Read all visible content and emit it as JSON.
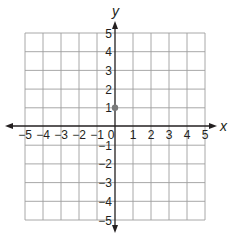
{
  "chart_data": {
    "type": "scatter",
    "title": "",
    "xlabel": "x",
    "ylabel": "y",
    "xlim": [
      -5,
      5
    ],
    "ylim": [
      -5,
      5
    ],
    "grid": true,
    "x_ticks": [
      "−5",
      "−4",
      "−3",
      "−2",
      "−1",
      "0",
      "1",
      "2",
      "3",
      "4",
      "5"
    ],
    "y_ticks": [
      "5",
      "4",
      "3",
      "2",
      "1",
      "−1",
      "−2",
      "−3",
      "−4",
      "−5"
    ],
    "points": [
      {
        "x": 0,
        "y": 1
      }
    ],
    "colors": {
      "grid": "#9e9e9e",
      "axis": "#231f20",
      "point": "#7a7a7a"
    }
  }
}
